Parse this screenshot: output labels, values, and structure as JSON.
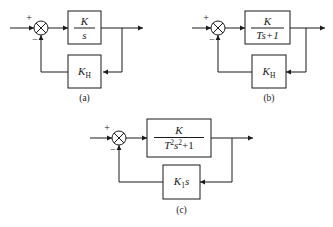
{
  "figure": {
    "background_color": "#ffffff",
    "line_color": "#1a1a1a",
    "type": "control-system-block-diagram"
  },
  "diagrams": [
    {
      "id": "a",
      "caption": "(a)",
      "summing_junction": {
        "name": "summing-junction",
        "glyph": "crossed-circle",
        "input_sign": "+",
        "feedback_sign": "−"
      },
      "forward_block": {
        "name": "forward-transfer-function",
        "numerator": "K",
        "denominator": "s",
        "is_fraction": true
      },
      "feedback_block": {
        "name": "feedback-gain",
        "gain_symbol": "K",
        "gain_subscript": "H"
      }
    },
    {
      "id": "b",
      "caption": "(b)",
      "summing_junction": {
        "name": "summing-junction",
        "glyph": "crossed-circle",
        "input_sign": "+",
        "feedback_sign": "−"
      },
      "forward_block": {
        "name": "forward-transfer-function",
        "numerator": "K",
        "denominator": "Ts+1",
        "is_fraction": true
      },
      "feedback_block": {
        "name": "feedback-gain",
        "gain_symbol": "K",
        "gain_subscript": "H"
      }
    },
    {
      "id": "c",
      "caption": "(c)",
      "summing_junction": {
        "name": "summing-junction",
        "glyph": "crossed-circle",
        "input_sign": "+",
        "feedback_sign": "−"
      },
      "forward_block": {
        "name": "forward-transfer-function",
        "numerator": "K",
        "denominator": "T²s²+1",
        "denominator_base1": "T",
        "denominator_exp1": "2",
        "denominator_base2": "s",
        "denominator_exp2": "2",
        "denominator_tail": "+1",
        "is_fraction": true
      },
      "feedback_block": {
        "name": "feedback-derivative-gain",
        "gain_symbol": "K",
        "gain_subscript": "1",
        "gain_tail": "s"
      }
    }
  ]
}
